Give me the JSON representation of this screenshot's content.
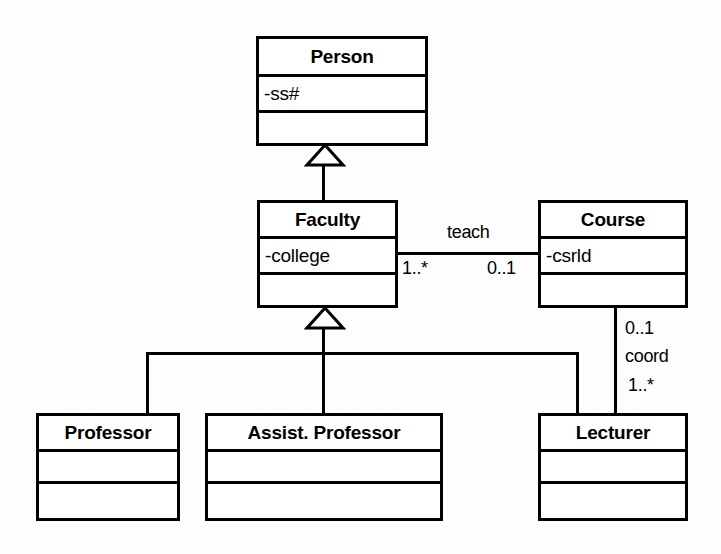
{
  "diagram": {
    "colors": {
      "stroke": "#000000",
      "fill": "#ffffff",
      "background": "#fdfdfd"
    },
    "classes": [
      {
        "id": "person",
        "name": "Person",
        "attributes": "-ss#",
        "operations": ""
      },
      {
        "id": "faculty",
        "name": "Faculty",
        "attributes": "-college",
        "operations": ""
      },
      {
        "id": "course",
        "name": "Course",
        "attributes": "-csrld",
        "operations": ""
      },
      {
        "id": "professor",
        "name": "Professor",
        "attributes": "",
        "operations": ""
      },
      {
        "id": "assist_professor",
        "name": "Assist. Professor",
        "attributes": "",
        "operations": ""
      },
      {
        "id": "lecturer",
        "name": "Lecturer",
        "attributes": "",
        "operations": ""
      }
    ],
    "associations": [
      {
        "id": "teach",
        "label": "teach",
        "from": "Faculty",
        "to": "Course",
        "from_multiplicity": "1..*",
        "to_multiplicity": "0..1"
      },
      {
        "id": "coord",
        "label": "coord",
        "from": "Course",
        "to": "Lecturer",
        "from_multiplicity": "0..1",
        "to_multiplicity": "1..*"
      }
    ],
    "generalizations": [
      {
        "id": "faculty-to-person",
        "subclass": "Faculty",
        "superclass": "Person"
      },
      {
        "id": "professor-to-faculty",
        "subclass": "Professor",
        "superclass": "Faculty"
      },
      {
        "id": "assist-professor-to-faculty",
        "subclass": "Assist. Professor",
        "superclass": "Faculty"
      },
      {
        "id": "lecturer-to-faculty",
        "subclass": "Lecturer",
        "superclass": "Faculty"
      }
    ]
  }
}
